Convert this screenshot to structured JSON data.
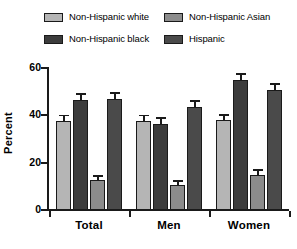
{
  "chart_data": {
    "type": "bar",
    "title": "",
    "xlabel": "",
    "ylabel": "Percent",
    "ylim": [
      0,
      60
    ],
    "yticks": [
      0,
      20,
      40,
      60
    ],
    "grid": false,
    "legend_position": "top",
    "categories": [
      "Total",
      "Men",
      "Women"
    ],
    "series": [
      {
        "name": "Non-Hispanic white",
        "color": "#b5b5b5",
        "values": [
          37.8,
          37.8,
          37.9
        ],
        "errors": [
          1.8,
          1.9,
          2.0
        ]
      },
      {
        "name": "Non-Hispanic black",
        "color": "#3c3c3c",
        "values": [
          46.4,
          36.5,
          54.8
        ],
        "errors": [
          2.2,
          2.0,
          2.4
        ]
      },
      {
        "name": "Non-Hispanic Asian",
        "color": "#8c8c8c",
        "values": [
          12.7,
          10.4,
          14.9
        ],
        "errors": [
          1.4,
          1.5,
          1.6
        ]
      },
      {
        "name": "Hispanic",
        "color": "#4a4a4a",
        "values": [
          46.9,
          43.4,
          50.6
        ],
        "errors": [
          2.2,
          2.4,
          2.3
        ]
      }
    ]
  },
  "legend": {
    "items": [
      {
        "label": "Non-Hispanic white",
        "color": "#b5b5b5"
      },
      {
        "label": "Non-Hispanic Asian",
        "color": "#8c8c8c"
      },
      {
        "label": "Non-Hispanic black",
        "color": "#3c3c3c"
      },
      {
        "label": "Hispanic",
        "color": "#4a4a4a"
      }
    ]
  },
  "axis": {
    "y_title": "Percent",
    "y_tick_labels": [
      "60",
      "40",
      "20",
      "0"
    ],
    "x_tick_labels": [
      "Total",
      "Men",
      "Women"
    ]
  }
}
